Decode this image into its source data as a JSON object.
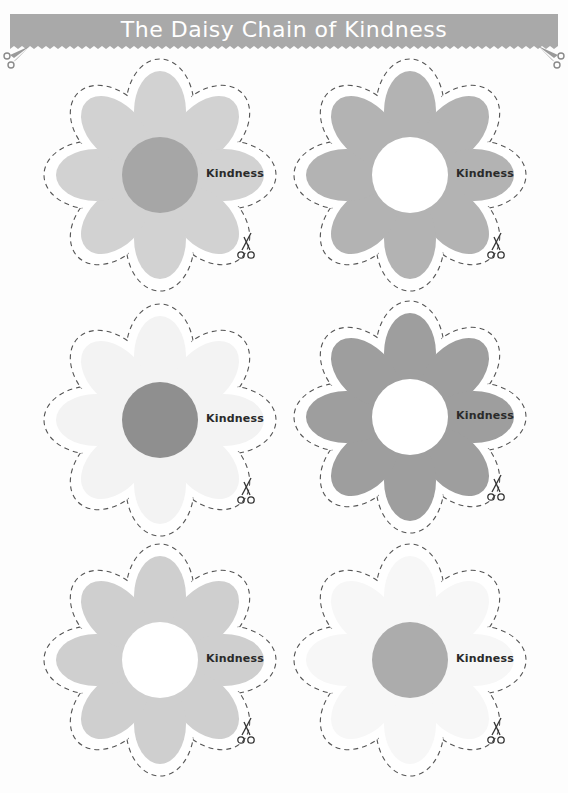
{
  "header": {
    "title": "The Daisy Chain of Kindness",
    "banner_color": "#a9a9a9",
    "title_color": "#ffffff",
    "corner_icons": [
      "scissors-icon",
      "scissors-icon"
    ]
  },
  "flowers": [
    {
      "label": "Kindness",
      "petal_color": "#d2d2d2",
      "center_color": "#a6a6a6",
      "cut_icon": "scissors-icon"
    },
    {
      "label": "Kindness",
      "petal_color": "#b3b3b3",
      "center_color": "#ffffff",
      "cut_icon": "scissors-icon"
    },
    {
      "label": "Kindness",
      "petal_color": "#f3f3f3",
      "center_color": "#8f8f8f",
      "cut_icon": "scissors-icon"
    },
    {
      "label": "Kindness",
      "petal_color": "#9e9e9e",
      "center_color": "#ffffff",
      "cut_icon": "scissors-icon"
    },
    {
      "label": "Kindness",
      "petal_color": "#cfcfcf",
      "center_color": "#ffffff",
      "cut_icon": "scissors-icon"
    },
    {
      "label": "Kindness",
      "petal_color": "#f7f7f7",
      "center_color": "#acacac",
      "cut_icon": "scissors-icon"
    }
  ]
}
